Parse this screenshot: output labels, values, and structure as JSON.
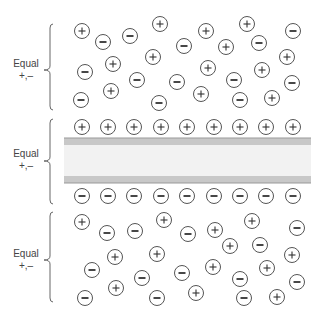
{
  "diagram": {
    "colors": {
      "ion_stroke": "#555555",
      "membrane_band": "#c8c8c8",
      "membrane_inner": "#f2f2f2",
      "membrane_edge": "#999999",
      "brace": "#666666",
      "text": "#444444"
    },
    "regions": [
      {
        "name": "top-bulk",
        "label_line1": "Equal",
        "label_line2": "+,–",
        "brace": {
          "top": 24,
          "bottom": 110,
          "mid": 70
        },
        "label_y": 58
      },
      {
        "name": "membrane",
        "label_line1": "Equal",
        "label_line2": "+,–",
        "brace": {
          "top": 119,
          "bottom": 204,
          "mid": 161
        },
        "label_y": 148
      },
      {
        "name": "bottom-bulk",
        "label_line1": "Equal",
        "label_line2": "+,–",
        "brace": {
          "top": 212,
          "bottom": 302,
          "mid": 260
        },
        "label_y": 248
      }
    ],
    "membrane": {
      "x": 64,
      "width": 247,
      "top_band": [
        138,
        145
      ],
      "inner": [
        145,
        176
      ],
      "bottom_band": [
        176,
        183
      ]
    },
    "ion_radius": 7.5,
    "ions": {
      "top": [
        {
          "x": 82,
          "y": 31,
          "c": "+"
        },
        {
          "x": 103,
          "y": 42,
          "c": "-"
        },
        {
          "x": 130,
          "y": 36,
          "c": "-"
        },
        {
          "x": 160,
          "y": 24,
          "c": "+"
        },
        {
          "x": 206,
          "y": 31,
          "c": "+"
        },
        {
          "x": 247,
          "y": 24,
          "c": "+"
        },
        {
          "x": 259,
          "y": 43,
          "c": "-"
        },
        {
          "x": 293,
          "y": 31,
          "c": "-"
        },
        {
          "x": 184,
          "y": 46,
          "c": "-"
        },
        {
          "x": 226,
          "y": 47,
          "c": "+"
        },
        {
          "x": 153,
          "y": 57,
          "c": "+"
        },
        {
          "x": 287,
          "y": 57,
          "c": "+"
        },
        {
          "x": 85,
          "y": 72,
          "c": "-"
        },
        {
          "x": 113,
          "y": 64,
          "c": "+"
        },
        {
          "x": 208,
          "y": 68,
          "c": "+"
        },
        {
          "x": 262,
          "y": 70,
          "c": "+"
        },
        {
          "x": 137,
          "y": 80,
          "c": "-"
        },
        {
          "x": 177,
          "y": 82,
          "c": "-"
        },
        {
          "x": 234,
          "y": 80,
          "c": "-"
        },
        {
          "x": 292,
          "y": 83,
          "c": "-"
        },
        {
          "x": 81,
          "y": 100,
          "c": "-"
        },
        {
          "x": 111,
          "y": 91,
          "c": "+"
        },
        {
          "x": 159,
          "y": 103,
          "c": "-"
        },
        {
          "x": 201,
          "y": 94,
          "c": "+"
        },
        {
          "x": 240,
          "y": 100,
          "c": "-"
        },
        {
          "x": 272,
          "y": 98,
          "c": "+"
        }
      ],
      "membrane_positive_row": {
        "y": 127,
        "c": "+",
        "xs": [
          82,
          108,
          134,
          161,
          187,
          214,
          240,
          266,
          293
        ]
      },
      "membrane_negative_row": {
        "y": 196,
        "c": "-",
        "xs": [
          82,
          108,
          134,
          161,
          187,
          214,
          240,
          266,
          293
        ]
      },
      "bottom": [
        {
          "x": 82,
          "y": 222,
          "c": "+"
        },
        {
          "x": 107,
          "y": 233,
          "c": "-"
        },
        {
          "x": 135,
          "y": 231,
          "c": "-"
        },
        {
          "x": 164,
          "y": 220,
          "c": "+"
        },
        {
          "x": 188,
          "y": 234,
          "c": "-"
        },
        {
          "x": 215,
          "y": 230,
          "c": "+"
        },
        {
          "x": 252,
          "y": 221,
          "c": "+"
        },
        {
          "x": 297,
          "y": 228,
          "c": "-"
        },
        {
          "x": 230,
          "y": 246,
          "c": "+"
        },
        {
          "x": 260,
          "y": 245,
          "c": "-"
        },
        {
          "x": 115,
          "y": 257,
          "c": "+"
        },
        {
          "x": 157,
          "y": 254,
          "c": "+"
        },
        {
          "x": 292,
          "y": 255,
          "c": "+"
        },
        {
          "x": 92,
          "y": 270,
          "c": "-"
        },
        {
          "x": 142,
          "y": 278,
          "c": "-"
        },
        {
          "x": 182,
          "y": 273,
          "c": "-"
        },
        {
          "x": 213,
          "y": 267,
          "c": "+"
        },
        {
          "x": 240,
          "y": 279,
          "c": "-"
        },
        {
          "x": 267,
          "y": 268,
          "c": "+"
        },
        {
          "x": 297,
          "y": 282,
          "c": "-"
        },
        {
          "x": 85,
          "y": 298,
          "c": "-"
        },
        {
          "x": 116,
          "y": 288,
          "c": "+"
        },
        {
          "x": 157,
          "y": 298,
          "c": "-"
        },
        {
          "x": 196,
          "y": 293,
          "c": "+"
        },
        {
          "x": 244,
          "y": 298,
          "c": "-"
        },
        {
          "x": 277,
          "y": 297,
          "c": "+"
        }
      ]
    }
  }
}
